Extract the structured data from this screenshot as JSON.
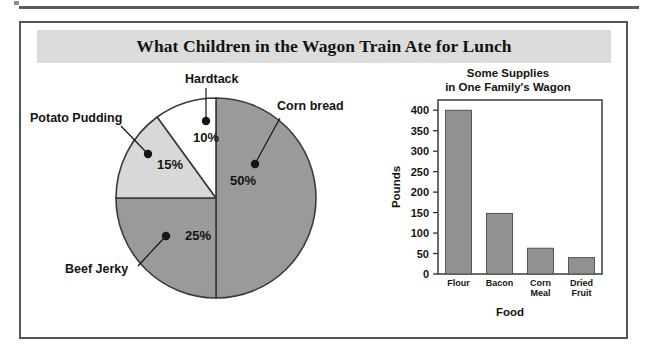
{
  "figure": {
    "title": "What Children in the Wagon Train Ate for Lunch",
    "title_band_color": "#dcdcdc",
    "border_color": "#555555"
  },
  "chart_data": [
    {
      "type": "pie",
      "title": "What Children in the Wagon Train Ate for Lunch",
      "categories": [
        "Corn bread",
        "Hardtack",
        "Potato Pudding",
        "Beef Jerky"
      ],
      "values": [
        50,
        15,
        25,
        10
      ],
      "value_labels": [
        "50%",
        "10%",
        "15%",
        "25%"
      ],
      "slices": [
        {
          "label": "Corn bread",
          "value": 50,
          "value_label": "50%",
          "color": "#9a9a9a"
        },
        {
          "label": "Hardtack",
          "value": 10,
          "value_label": "10%",
          "color": "#ffffff"
        },
        {
          "label": "Potato Pudding",
          "value": 15,
          "value_label": "15%",
          "color": "#d8d8d8"
        },
        {
          "label": "Beef Jerky",
          "value": 25,
          "value_label": "25%",
          "color": "#9a9a9a"
        }
      ],
      "legend": "labels-with-leader-lines",
      "units": "percent"
    },
    {
      "type": "bar",
      "title_line1": "Some Supplies",
      "title_line2": "in One Family's Wagon",
      "categories": [
        "Flour",
        "Bacon",
        "Corn Meal",
        "Dried Fruit"
      ],
      "category_lines": [
        [
          "Flour"
        ],
        [
          "Bacon"
        ],
        [
          "Corn",
          "Meal"
        ],
        [
          "Dried",
          "Fruit"
        ]
      ],
      "values": [
        400,
        148,
        63,
        40
      ],
      "xlabel": "Food",
      "ylabel": "Pounds",
      "ylim": [
        0,
        425
      ],
      "yticks": [
        0,
        50,
        100,
        150,
        200,
        250,
        300,
        350,
        400
      ],
      "ytick_labels": [
        "0",
        "50",
        "100",
        "150",
        "200",
        "250",
        "300",
        "350",
        "400"
      ],
      "grid": false,
      "bar_color": "#919191",
      "legend": "none"
    }
  ]
}
